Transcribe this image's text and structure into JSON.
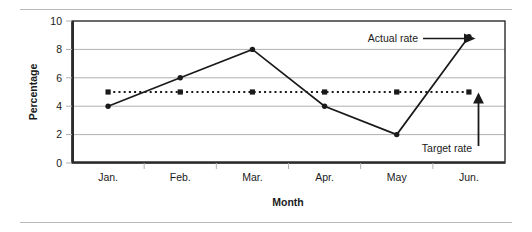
{
  "chart_data": {
    "type": "line",
    "title": "",
    "xlabel": "Month",
    "ylabel": "Percentage",
    "categories": [
      "Jan.",
      "Feb.",
      "Mar.",
      "Apr.",
      "May",
      "Jun."
    ],
    "ylim": [
      0,
      10
    ],
    "yticks": [
      0,
      2,
      4,
      6,
      8,
      10
    ],
    "grid": "horizontal",
    "legend_position": "none",
    "series": [
      {
        "name": "Actual rate",
        "style": "solid",
        "marker": "circle",
        "color": "#1a1a1a",
        "values": [
          4,
          6,
          8,
          4,
          2,
          8.9
        ]
      },
      {
        "name": "Target rate",
        "style": "dotted",
        "marker": "square",
        "color": "#1a1a1a",
        "values": [
          5,
          5,
          5,
          5,
          5,
          5
        ]
      }
    ],
    "annotations": [
      {
        "text": "Actual rate",
        "arrow": "right",
        "points_to": {
          "category": "Jun.",
          "value": 8.9
        }
      },
      {
        "text": "Target rate",
        "arrow": "up",
        "points_to": {
          "category": "Jun.",
          "value": 5
        }
      }
    ]
  },
  "axes": {
    "y_tick_labels": [
      "10",
      "8",
      "6",
      "4",
      "2",
      "0"
    ],
    "x_tick_labels": [
      "Jan.",
      "Feb.",
      "Mar.",
      "Apr.",
      "May",
      "Jun."
    ],
    "y_axis_title": "Percentage",
    "x_axis_title": "Month"
  },
  "annotations": {
    "actual_rate_label": "Actual rate",
    "target_rate_label": "Target rate"
  },
  "colors": {
    "line": "#1a1a1a",
    "grid": "#b0b0b0",
    "axis": "#2b2b2b",
    "rule": "#b9b9b9",
    "background": "#ffffff"
  }
}
